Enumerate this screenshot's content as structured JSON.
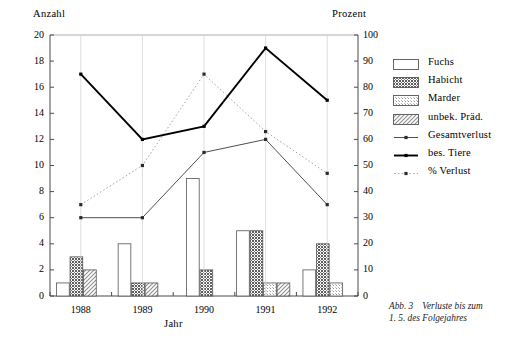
{
  "axes": {
    "left_title": "Anzahl",
    "right_title": "Prozent",
    "x_title": "Jahr",
    "left_ticks": [
      "0",
      "2",
      "4",
      "6",
      "8",
      "10",
      "12",
      "14",
      "16",
      "18",
      "20"
    ],
    "right_ticks": [
      "0",
      "10",
      "20",
      "30",
      "40",
      "50",
      "60",
      "70",
      "80",
      "90",
      "100"
    ]
  },
  "legend": {
    "items": [
      {
        "label": "Fuchs",
        "key": "swatch-empty"
      },
      {
        "label": "Habicht",
        "key": "swatch-dark-dense"
      },
      {
        "label": "Marder",
        "key": "swatch-light-dots"
      },
      {
        "label": "unbek. Präd.",
        "key": "swatch-diagonal-hatch"
      },
      {
        "label": "Gesamtverlust",
        "key": "line-thin-marker"
      },
      {
        "label": "bes. Tiere",
        "key": "line-thick-solid"
      },
      {
        "label": "% Verlust",
        "key": "line-dotted-marker"
      }
    ]
  },
  "caption": {
    "number": "Abb. 3",
    "line1": "Verluste bis zum",
    "line2": "1. 5. des Folgejahres"
  },
  "chart_data": {
    "type": "bar",
    "title": "",
    "xlabel": "Jahr",
    "ylabel": "Anzahl",
    "y2label": "Prozent",
    "ylim": [
      0,
      20
    ],
    "y2lim": [
      0,
      100
    ],
    "grid": false,
    "legend_position": "right",
    "categories": [
      "1988",
      "1989",
      "1990",
      "1991",
      "1992"
    ],
    "bar_series": [
      {
        "name": "Fuchs",
        "axis": "left",
        "values": [
          1,
          4,
          9,
          5,
          2
        ]
      },
      {
        "name": "Habicht",
        "axis": "left",
        "values": [
          3,
          1,
          2,
          5,
          4
        ]
      },
      {
        "name": "Marder",
        "axis": "left",
        "values": [
          null,
          null,
          null,
          1,
          1
        ]
      },
      {
        "name": "unbek. Präd.",
        "axis": "left",
        "values": [
          2,
          1,
          null,
          1,
          null
        ]
      }
    ],
    "line_series": [
      {
        "name": "Gesamtverlust",
        "axis": "left",
        "style": "thin-solid",
        "values": [
          6,
          6,
          11,
          12,
          7
        ]
      },
      {
        "name": "bes. Tiere",
        "axis": "left",
        "style": "thick-solid",
        "values": [
          17,
          12,
          13,
          19,
          15
        ]
      },
      {
        "name": "% Verlust",
        "axis": "right",
        "style": "dotted",
        "values": [
          35,
          50,
          85,
          63,
          47
        ]
      }
    ]
  }
}
